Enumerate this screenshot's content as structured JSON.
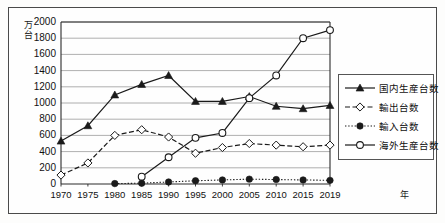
{
  "chart_data": {
    "type": "line",
    "title": "",
    "xlabel": "年",
    "ylabel": "万台",
    "ylim": [
      0,
      2000
    ],
    "ytick_step": 200,
    "grid": "horizontal",
    "legend_position": "right",
    "categories": [
      "1970",
      "1975",
      "1980",
      "1985",
      "1990",
      "1995",
      "2000",
      "2005",
      "2010",
      "2015",
      "2019"
    ],
    "yticks": [
      "0",
      "200",
      "400",
      "600",
      "800",
      "1000",
      "1200",
      "1400",
      "1600",
      "1800",
      "2000"
    ],
    "series": [
      {
        "name": "国内生産台数",
        "marker": "filled-triangle",
        "line": "solid",
        "color": "#1a1a1a",
        "values": [
          530,
          720,
          1100,
          1230,
          1340,
          1020,
          1020,
          1080,
          960,
          930,
          970
        ]
      },
      {
        "name": "輸出台数",
        "marker": "open-diamond",
        "line": "dashed",
        "color": "#1a1a1a",
        "values": [
          110,
          260,
          600,
          670,
          580,
          380,
          450,
          500,
          480,
          460,
          480
        ]
      },
      {
        "name": "輸入台数",
        "marker": "filled-circle",
        "line": "dotted",
        "color": "#1a1a1a",
        "values": [
          0,
          0,
          5,
          10,
          25,
          40,
          50,
          60,
          55,
          50,
          45
        ]
      },
      {
        "name": "海外生産台数",
        "marker": "open-circle",
        "line": "solid",
        "color": "#1a1a1a",
        "values": [
          0,
          0,
          0,
          90,
          330,
          570,
          630,
          1060,
          1340,
          1800,
          1900
        ]
      }
    ]
  },
  "axis": {
    "y_unit_line1": "万",
    "y_unit_line2": "台",
    "x_unit": "年"
  }
}
